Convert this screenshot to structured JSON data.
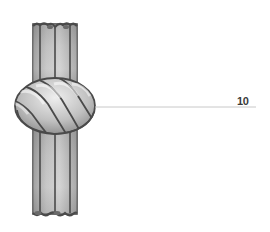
{
  "figure": {
    "callouts": [
      {
        "id": "callout-10",
        "label": "10",
        "target": "knot"
      }
    ],
    "colors": {
      "background": "#ffffff",
      "outline": "#4a4a4a",
      "strand_light": "#e6e6e6",
      "strand_dark": "#8c8c8c",
      "leader_line": "#c8c8c8",
      "label_text": "#3a3a3a"
    }
  }
}
